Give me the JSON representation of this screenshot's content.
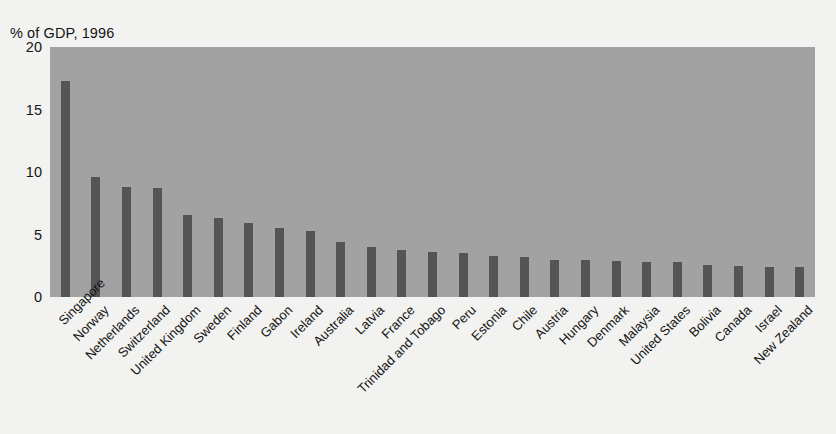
{
  "chart_data": {
    "type": "bar",
    "title": "% of GDP, 1996",
    "xlabel": "",
    "ylabel": "",
    "ylim": [
      0,
      20
    ],
    "yticks": [
      0,
      5,
      10,
      15,
      20
    ],
    "ytick_labels": [
      "0",
      "5",
      "10",
      "15",
      "20"
    ],
    "grid": false,
    "legend": null,
    "legend_position": "none",
    "bar_color": "#555456",
    "plot_background_color": "#a2a2a2",
    "figure_background_color": "#f2f2f0",
    "xtick_label_rotation": -45,
    "categories": [
      "Singapore",
      "Norway",
      "Netherlands",
      "Switzerland",
      "United Kingdom",
      "Sweden",
      "Finland",
      "Gabon",
      "Ireland",
      "Australia",
      "Latvia",
      "France",
      "Trinidad and Tobago",
      "Peru",
      "Estonia",
      "Chile",
      "Austria",
      "Hungary",
      "Denmark",
      "Malaysia",
      "United States",
      "Bolivia",
      "Canada",
      "Israel",
      "New Zealand"
    ],
    "values": [
      17.3,
      9.6,
      8.8,
      8.7,
      6.6,
      6.3,
      5.9,
      5.5,
      5.3,
      4.4,
      4.0,
      3.8,
      3.6,
      3.5,
      3.3,
      3.2,
      3.0,
      3.0,
      2.9,
      2.8,
      2.8,
      2.6,
      2.5,
      2.4,
      2.4
    ]
  }
}
